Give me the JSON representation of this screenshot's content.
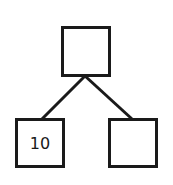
{
  "diagram": {
    "type": "tree",
    "nodes": [
      {
        "id": "root",
        "label": "",
        "x": 61,
        "y": 26,
        "w": 50,
        "h": 51
      },
      {
        "id": "left",
        "label": "10",
        "x": 15,
        "y": 118,
        "w": 50,
        "h": 50
      },
      {
        "id": "right",
        "label": "",
        "x": 108,
        "y": 118,
        "w": 50,
        "h": 50
      }
    ],
    "edges": [
      {
        "from": "root",
        "to": "left"
      },
      {
        "from": "root",
        "to": "right"
      }
    ],
    "colors": {
      "stroke": "#1a1a1a",
      "fill": "#ffffff"
    }
  }
}
